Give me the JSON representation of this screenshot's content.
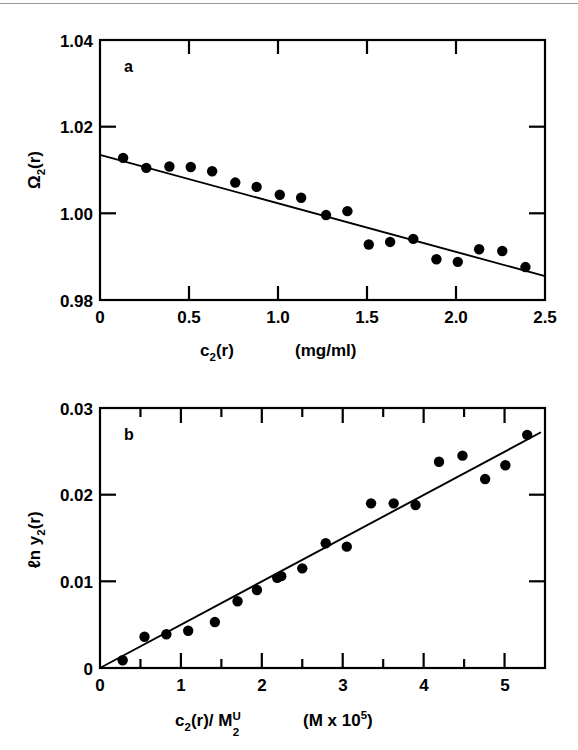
{
  "figure": {
    "title": "",
    "panels": [
      "a",
      "b"
    ]
  },
  "panel_a": {
    "label": "a",
    "ylabel_main": "Ω",
    "ylabel_sub": "2",
    "ylabel_tail": "(r)",
    "xlabel_main": "c",
    "xlabel_sub": "2",
    "xlabel_tail": "(r)",
    "xlabel_units": "(mg/ml)",
    "ytick_labels": [
      "1.04",
      "1.02",
      "1.00",
      "0.98"
    ],
    "xtick_labels": [
      "0",
      "0.5",
      "1.0",
      "1.5",
      "2.0",
      "2.5"
    ]
  },
  "panel_b": {
    "label": "b",
    "ylabel_main": "ℓn y",
    "ylabel_sub": "2",
    "ylabel_tail": "(r)",
    "xlabel_main": "c",
    "xlabel_sub": "2",
    "xlabel_mid": "(r)/ M",
    "xlabel_sub2": "2",
    "xlabel_sup2": "U",
    "xlabel_units_pre": "(M x 10",
    "xlabel_units_sup": "5",
    "xlabel_units_post": ")",
    "ytick_labels": [
      "0.03",
      "0.02",
      "0.01",
      "0"
    ],
    "xtick_labels": [
      "0",
      "1",
      "2",
      "3",
      "4",
      "5"
    ]
  },
  "chart_data": [
    {
      "type": "scatter",
      "panel": "a",
      "title": "",
      "xlabel": "c2(r)  (mg/ml)",
      "ylabel": "Ω2(r)",
      "xlim": [
        0,
        2.5
      ],
      "ylim": [
        0.98,
        1.04
      ],
      "xticks": [
        0,
        0.5,
        1.0,
        1.5,
        2.0,
        2.5
      ],
      "yticks": [
        0.98,
        1.0,
        1.02,
        1.04
      ],
      "grid": false,
      "legend": "none",
      "marker": "filled-circle",
      "marker_color": "#000000",
      "x": [
        0.13,
        0.26,
        0.39,
        0.51,
        0.63,
        0.76,
        0.88,
        1.01,
        1.13,
        1.27,
        1.39,
        1.51,
        1.63,
        1.76,
        1.89,
        2.01,
        2.13,
        2.26,
        2.39
      ],
      "y": [
        1.0128,
        1.0105,
        1.0108,
        1.0107,
        1.0097,
        1.0071,
        1.0061,
        1.0043,
        1.0036,
        0.9996,
        1.0005,
        0.9928,
        0.9934,
        0.9941,
        0.9894,
        0.9888,
        0.9917,
        0.9913,
        0.9876
      ],
      "fit_line": {
        "name": "linear fit",
        "x": [
          0.0,
          2.5
        ],
        "y": [
          1.0135,
          0.9855
        ],
        "slope": -0.0112,
        "intercept": 1.0135
      }
    },
    {
      "type": "scatter",
      "panel": "b",
      "title": "",
      "xlabel": "c2(r)/M2^U  (M x 10^5)",
      "ylabel": "ℓn y2(r)",
      "xlim": [
        0,
        5.5
      ],
      "ylim": [
        0,
        0.03
      ],
      "xticks": [
        0,
        1,
        2,
        3,
        4,
        5
      ],
      "yticks": [
        0,
        0.01,
        0.02,
        0.03
      ],
      "minor_xticks": [
        0.5,
        1.5,
        2.5,
        3.5,
        4.5,
        5.5
      ],
      "grid": false,
      "legend": "none",
      "marker": "filled-circle",
      "marker_color": "#000000",
      "x": [
        0.28,
        0.55,
        0.82,
        1.09,
        1.42,
        1.7,
        1.94,
        2.19,
        2.24,
        2.5,
        2.79,
        3.05,
        3.35,
        3.63,
        3.9,
        4.19,
        4.48,
        4.76,
        5.01,
        5.28
      ],
      "y": [
        0.0009,
        0.0036,
        0.0039,
        0.0043,
        0.0053,
        0.0077,
        0.009,
        0.0104,
        0.0106,
        0.0115,
        0.0144,
        0.014,
        0.019,
        0.019,
        0.0188,
        0.0238,
        0.0245,
        0.0218,
        0.0234,
        0.0269
      ],
      "fit_line": {
        "name": "linear fit",
        "x": [
          0.0,
          5.45
        ],
        "y": [
          0.0,
          0.0272
        ],
        "slope": 0.005,
        "intercept": 0.0
      }
    }
  ]
}
